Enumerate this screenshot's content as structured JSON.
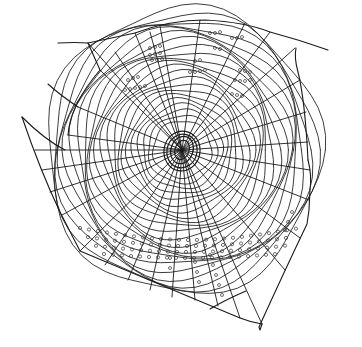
{
  "image": {
    "subject": "orb spider web line drawing",
    "background_color": "#ffffff",
    "line_color": "#1a1a1a",
    "hub_center": [
      182,
      150
    ],
    "frame_threads": 7,
    "radial_threads": 32,
    "spiral_rings": 22,
    "droplet_rows": [
      "upper-left sector",
      "upper sector",
      "lower band"
    ]
  }
}
